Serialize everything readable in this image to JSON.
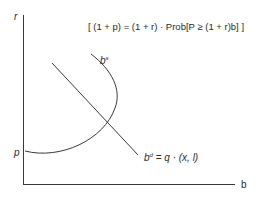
{
  "diagram": {
    "equation": "[ (1 + p) = (1 + r) · Prob[P ≥ (1 + r)b] ]",
    "axes": {
      "y_label": "r",
      "x_label": "b"
    },
    "y_intercept_label": "p",
    "supply_curve": {
      "base": "b",
      "sup": "s"
    },
    "demand_curve": {
      "base": "b",
      "sup": "d",
      "rest": " = q · (x, l)"
    },
    "stroke_color": "#3a3a3a"
  }
}
